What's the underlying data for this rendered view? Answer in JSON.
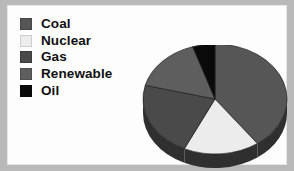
{
  "figure": {
    "background_color": "#b9b9b9",
    "plate_color": "#fdfdfd"
  },
  "legend": {
    "items": [
      {
        "label": "Coal",
        "color": "#565656"
      },
      {
        "label": "Nuclear",
        "color": "#ececec"
      },
      {
        "label": "Gas",
        "color": "#4a4a4a"
      },
      {
        "label": "Renewable",
        "color": "#5e5e5e"
      },
      {
        "label": "Oil",
        "color": "#0a0a0a"
      }
    ]
  },
  "chart_data": {
    "type": "pie",
    "title": "",
    "categories": [
      "Coal",
      "Nuclear",
      "Gas",
      "Renewable",
      "Oil"
    ],
    "values": [
      40,
      17,
      22,
      16,
      5
    ],
    "colors": [
      "#565656",
      "#ececec",
      "#4a4a4a",
      "#5e5e5e",
      "#0a0a0a"
    ],
    "legend_position": "left",
    "three_d": true,
    "start_angle_deg": 0,
    "direction": "clockwise",
    "depth_color": "#2f2f2f",
    "center": [
      78,
      54
    ],
    "radius_x": 72,
    "radius_y": 55,
    "depth": 14
  }
}
